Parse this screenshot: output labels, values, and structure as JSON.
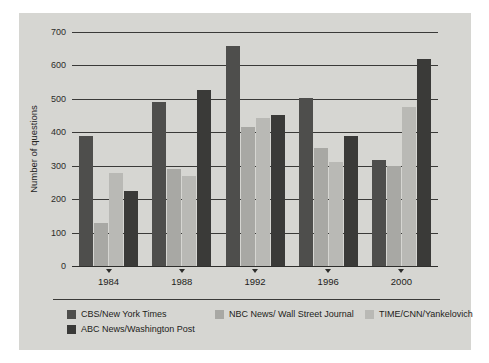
{
  "chart_data": {
    "type": "bar",
    "title": "",
    "xlabel": "",
    "ylabel": "Number of questions",
    "categories": [
      "1984",
      "1988",
      "1992",
      "1996",
      "2000"
    ],
    "ylim": [
      0,
      700
    ],
    "yticks": [
      0,
      100,
      200,
      300,
      400,
      500,
      600,
      700
    ],
    "ytick_labels": [
      "0",
      "100",
      "200",
      "300",
      "400",
      "500",
      "600",
      "700"
    ],
    "grid": true,
    "legend_position": "bottom",
    "series": [
      {
        "name": "CBS/New York Times",
        "color": "#4e4e4c",
        "values": [
          388,
          490,
          658,
          503,
          318
        ]
      },
      {
        "name": "NBC News/ Wall Street Journal",
        "color": "#a8a8a4",
        "values": [
          130,
          290,
          415,
          352,
          298
        ]
      },
      {
        "name": "TIME/CNN/Yankelovich",
        "color": "#b9b9b5",
        "values": [
          277,
          270,
          442,
          310,
          475
        ]
      },
      {
        "name": "ABC News/Washington Post",
        "color": "#3a3a38",
        "values": [
          225,
          528,
          453,
          390,
          618
        ]
      }
    ]
  },
  "figure": {
    "background_color": "#d6d6d2",
    "page_color": "#ffffff",
    "axis_color": "#2e2e2c"
  }
}
